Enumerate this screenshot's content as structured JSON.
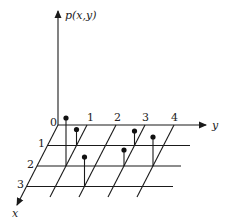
{
  "diagram": {
    "title": "",
    "vertical_axis_label": "p(x,y)",
    "y_axis_label": "y",
    "x_axis_label": "x",
    "y_ticks": [
      "0",
      "1",
      "2",
      "3",
      "4"
    ],
    "x_ticks": [
      "1",
      "2",
      "3"
    ],
    "stems": [
      {
        "x": 2,
        "y": 1,
        "height": 48
      },
      {
        "x": 1,
        "y": 1,
        "height": 16
      },
      {
        "x": 3,
        "y": 2,
        "height": 28
      },
      {
        "x": 1,
        "y": 3,
        "height": 14
      },
      {
        "x": 2,
        "y": 3,
        "height": 17
      },
      {
        "x": 2,
        "y": 4,
        "height": 30
      }
    ],
    "colors": {
      "ink": "#1a1a1a",
      "background": "#ffffff"
    }
  }
}
